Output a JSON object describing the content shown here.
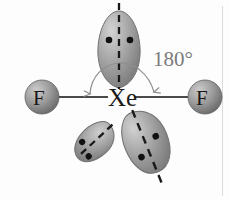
{
  "diagram": {
    "background_color": "#fdfdfd",
    "central_atom": {
      "symbol": "Xe",
      "name": "xenon",
      "x": 119,
      "y": 97
    },
    "ligands": [
      {
        "symbol": "F",
        "name": "fluorine-left",
        "x": 42,
        "y": 97,
        "radius": 17
      },
      {
        "symbol": "F",
        "name": "fluorine-right",
        "x": 205,
        "y": 97,
        "radius": 17
      }
    ],
    "bond_angle": {
      "value": "180°",
      "label_x": 153,
      "label_y": 47
    },
    "lone_pairs": [
      {
        "name": "lone-pair-top",
        "electrons": 2,
        "direction": "up"
      },
      {
        "name": "lone-pair-lower-left",
        "electrons": 2,
        "direction": "down-left"
      },
      {
        "name": "lone-pair-lower-right",
        "electrons": 2,
        "direction": "down-right"
      }
    ],
    "colors": {
      "lobe_fill_light": "#c9c9c9",
      "lobe_fill_mid": "#9d9d9d",
      "lobe_fill_dark": "#7d7d7d",
      "lobe_stroke": "#6f6f6f",
      "atom_fill_light": "#c6c6c6",
      "atom_fill_dark": "#6e6e6e",
      "bond_color": "#4a4a4a",
      "dash_color": "#191919",
      "electron_dot_color": "#111111",
      "arc_color": "#8d8d8d",
      "text_color": "#1c1c1c",
      "angle_text_color": "#7b7b7b",
      "margin_rule_color": "#d8d8d8"
    }
  }
}
